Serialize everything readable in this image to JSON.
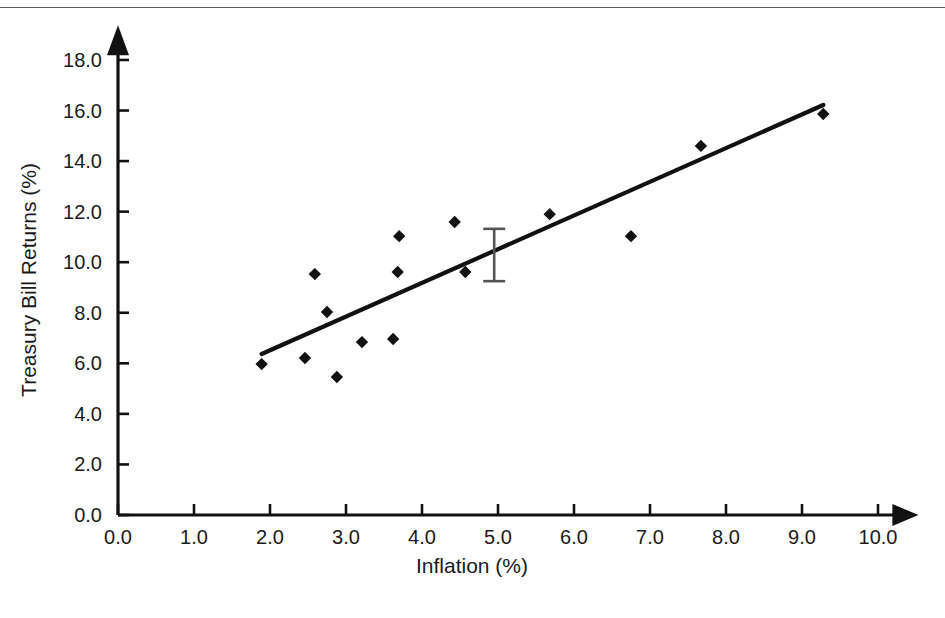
{
  "chart_data": {
    "type": "scatter",
    "title": "",
    "xlabel": "Inflation (%)",
    "ylabel": "Treasury Bill Returns (%)",
    "xlim": [
      0.0,
      10.4
    ],
    "ylim": [
      0.0,
      18.9
    ],
    "grid": false,
    "legend": "none",
    "x_ticks": [
      0.0,
      1.0,
      2.0,
      3.0,
      4.0,
      5.0,
      6.0,
      7.0,
      8.0,
      9.0,
      10.0
    ],
    "x_tick_labels": [
      "0.0",
      "1.0",
      "2.0",
      "3.0",
      "4.0",
      "5.0",
      "6.0",
      "7.0",
      "8.0",
      "9.0",
      "10.0"
    ],
    "y_ticks": [
      0.0,
      2.0,
      4.0,
      6.0,
      8.0,
      10.0,
      12.0,
      14.0,
      16.0,
      18.0
    ],
    "y_tick_labels": [
      "0.0",
      "2.0",
      "4.0",
      "6.0",
      "8.0",
      "10.0",
      "12.0",
      "14.0",
      "16.0",
      "18.0"
    ],
    "points": [
      {
        "x": 1.89,
        "y": 5.97
      },
      {
        "x": 2.46,
        "y": 6.21
      },
      {
        "x": 2.59,
        "y": 9.53
      },
      {
        "x": 2.75,
        "y": 8.03
      },
      {
        "x": 2.88,
        "y": 5.46
      },
      {
        "x": 3.21,
        "y": 6.84
      },
      {
        "x": 3.62,
        "y": 6.96
      },
      {
        "x": 3.68,
        "y": 9.61
      },
      {
        "x": 3.7,
        "y": 11.03
      },
      {
        "x": 4.43,
        "y": 11.59
      },
      {
        "x": 4.57,
        "y": 9.61
      },
      {
        "x": 5.68,
        "y": 11.9
      },
      {
        "x": 6.75,
        "y": 11.03
      },
      {
        "x": 7.67,
        "y": 14.6
      },
      {
        "x": 9.28,
        "y": 15.86
      }
    ],
    "trend_line": {
      "x_start": 1.89,
      "y_start": 6.37,
      "x_end": 9.28,
      "y_end": 16.22
    },
    "error_bar": {
      "x": 4.95,
      "y": 10.4,
      "y_low": 9.25,
      "y_high": 11.32
    },
    "marker_style": "diamond",
    "marker_color": "#111111",
    "line_color": "#111111",
    "errorbar_color": "#555555"
  }
}
